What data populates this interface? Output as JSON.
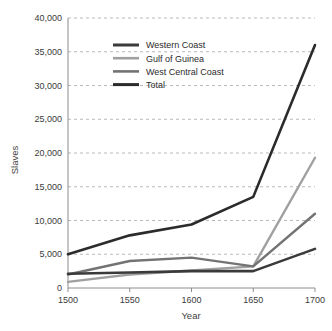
{
  "chart_data": {
    "type": "line",
    "title": "",
    "xlabel": "Year",
    "ylabel": "Slaves",
    "x": [
      1500,
      1550,
      1600,
      1650,
      1700
    ],
    "categories": [
      "1500",
      "1550",
      "1600",
      "1650",
      "1700"
    ],
    "xlim": [
      1500,
      1700
    ],
    "ylim": [
      0,
      40000
    ],
    "ytick_values": [
      0,
      5000,
      10000,
      15000,
      20000,
      25000,
      30000,
      35000,
      40000
    ],
    "ytick_labels": [
      "0",
      "5,000",
      "10,000",
      "15,000",
      "20,000",
      "25,000",
      "30,000",
      "35,000",
      "40,000"
    ],
    "grid": "horizontal-dashed",
    "legend_position": "upper-left-inside",
    "series": [
      {
        "name": "Western Coast",
        "color": "#3a3a3a",
        "values": [
          2100,
          2300,
          2500,
          2500,
          5800
        ]
      },
      {
        "name": "Gulf of Guinea",
        "color": "#a0a0a0",
        "values": [
          900,
          2000,
          2600,
          3200,
          19300
        ]
      },
      {
        "name": "West Central Coast",
        "color": "#737373",
        "values": [
          2000,
          4000,
          4500,
          3200,
          11000
        ]
      },
      {
        "name": "Total",
        "color": "#2b2b2b",
        "values": [
          5000,
          7800,
          9400,
          13500,
          36000
        ]
      }
    ]
  },
  "legend": {
    "items": [
      {
        "label": "Western Coast",
        "color": "#3a3a3a",
        "thickness": 3.0
      },
      {
        "label": "Gulf of Guinea",
        "color": "#a0a0a0",
        "thickness": 2.6
      },
      {
        "label": "West Central Coast",
        "color": "#737373",
        "thickness": 2.6
      },
      {
        "label": "Total",
        "color": "#2b2b2b",
        "thickness": 3.0
      }
    ]
  },
  "axes": {
    "y_title": "Slaves",
    "x_title": "Year",
    "axis_color": "#8c8c8c",
    "grid_color": "#b9b9b9"
  }
}
